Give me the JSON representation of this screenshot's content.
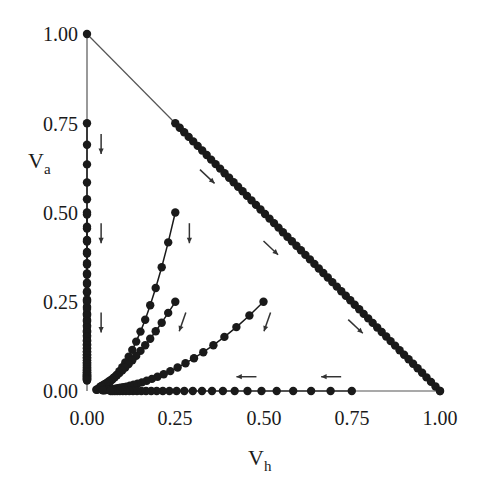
{
  "chart_data": {
    "type": "scatter",
    "title": "",
    "xlabel": "V_h",
    "ylabel": "V_a",
    "xlabel_main": "V",
    "xlabel_sub": "h",
    "ylabel_main": "V",
    "ylabel_sub": "a",
    "xlim": [
      0,
      1
    ],
    "ylim": [
      0,
      1
    ],
    "grid": false,
    "legend": "none",
    "x_ticks": [
      "0.00",
      "0.25",
      "0.50",
      "0.75",
      "1.00"
    ],
    "y_ticks": [
      "0.00",
      "0.25",
      "0.50",
      "0.75",
      "1.00"
    ],
    "colors": {
      "points": "#1a1a1a",
      "lines": "#555555",
      "background": "#ffffff"
    },
    "boundary_lines": [
      {
        "name": "hypotenuse V_a + V_h = 1",
        "from": [
          0,
          1
        ],
        "to": [
          1,
          0
        ]
      },
      {
        "name": "V_a axis segment",
        "from": [
          0,
          1
        ],
        "to": [
          0,
          0
        ]
      },
      {
        "name": "V_h axis segment",
        "from": [
          0.75,
          0
        ],
        "to": [
          1,
          0
        ]
      }
    ],
    "series": [
      {
        "name": "start (0.00, 1.00)",
        "start": [
          0,
          1
        ],
        "end": [
          0,
          1
        ],
        "kind": "fixed",
        "points": [
          [
            0,
            1
          ]
        ]
      },
      {
        "name": "start (0.00, 0.75)",
        "start": [
          0,
          0.75
        ],
        "end": [
          0,
          0
        ],
        "kind": "vertical",
        "n": 40
      },
      {
        "name": "start (0.00, 0.50)",
        "start": [
          0,
          0.5
        ],
        "end": [
          0,
          0
        ],
        "kind": "vertical",
        "n": 34
      },
      {
        "name": "start (0.00, 0.25)",
        "start": [
          0,
          0.25
        ],
        "end": [
          0,
          0
        ],
        "kind": "vertical",
        "n": 26
      },
      {
        "name": "start (0.25, 0.75)",
        "start": [
          0.25,
          0.75
        ],
        "end": [
          1,
          0
        ],
        "kind": "diagonal",
        "n": 60
      },
      {
        "name": "start (0.25, 0.50)",
        "start": [
          0.25,
          0.5
        ],
        "end": [
          0,
          0
        ],
        "kind": "curve",
        "power": 2.2,
        "n": 28
      },
      {
        "name": "start (0.25, 0.25)",
        "start": [
          0.25,
          0.25
        ],
        "end": [
          0,
          0
        ],
        "kind": "curve",
        "power": 1.6,
        "n": 24
      },
      {
        "name": "start (0.50, 0.25)",
        "start": [
          0.5,
          0.25
        ],
        "end": [
          0,
          0
        ],
        "kind": "curve",
        "power": 2.0,
        "n": 30
      },
      {
        "name": "start (0.75, 0.00)",
        "start": [
          0.75,
          0
        ],
        "end": [
          0,
          0
        ],
        "kind": "horizontal",
        "n": 30
      },
      {
        "name": "start (1.00, 0.00)",
        "start": [
          1,
          0
        ],
        "end": [
          1,
          0
        ],
        "kind": "fixed",
        "points": [
          [
            1,
            0
          ]
        ]
      }
    ],
    "annotations": [
      {
        "type": "arrow",
        "at": [
          0.04,
          0.72
        ],
        "direction": "down"
      },
      {
        "type": "arrow",
        "at": [
          0.04,
          0.47
        ],
        "direction": "down"
      },
      {
        "type": "arrow",
        "at": [
          0.04,
          0.22
        ],
        "direction": "down"
      },
      {
        "type": "arrow",
        "at": [
          0.29,
          0.47
        ],
        "direction": "down"
      },
      {
        "type": "arrow",
        "at": [
          0.28,
          0.22
        ],
        "direction": "down-left"
      },
      {
        "type": "arrow",
        "at": [
          0.52,
          0.22
        ],
        "direction": "down-left"
      },
      {
        "type": "arrow",
        "at": [
          0.48,
          0.04
        ],
        "direction": "left"
      },
      {
        "type": "arrow",
        "at": [
          0.72,
          0.04
        ],
        "direction": "left"
      },
      {
        "type": "arrow",
        "at": [
          0.32,
          0.62
        ],
        "direction": "down-right"
      },
      {
        "type": "arrow",
        "at": [
          0.5,
          0.42
        ],
        "direction": "down-right"
      },
      {
        "type": "arrow",
        "at": [
          0.74,
          0.2
        ],
        "direction": "down-right"
      }
    ]
  }
}
